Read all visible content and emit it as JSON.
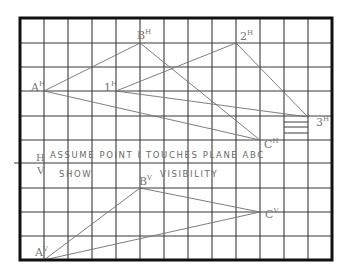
{
  "drawing": {
    "notes": {
      "line1": "ASSUME POINT I TOUCHES PLANE ABC",
      "line2a": "SHOW",
      "line2b": "VISIBILITY"
    },
    "fold_labels": {
      "top": "H",
      "bottom": "V"
    },
    "grid": {
      "cols": 13,
      "rows": 10,
      "x0": 20,
      "y0": 18,
      "x1": 332,
      "y1": 260
    },
    "points_horizontal": [
      {
        "id": "A",
        "label": "A",
        "sup": "H",
        "x": 44,
        "y": 91
      },
      {
        "id": "B",
        "label": "B",
        "sup": "H",
        "x": 140,
        "y": 43
      },
      {
        "id": "C",
        "label": "C",
        "sup": "H",
        "x": 260,
        "y": 140
      },
      {
        "id": "1",
        "label": "1",
        "sup": "H",
        "x": 116,
        "y": 91
      },
      {
        "id": "2",
        "label": "2",
        "sup": "H",
        "x": 236,
        "y": 43
      },
      {
        "id": "3",
        "label": "3",
        "sup": "H",
        "x": 308,
        "y": 117
      }
    ],
    "points_vertical": [
      {
        "id": "A",
        "label": "A",
        "sup": "V",
        "x": 44,
        "y": 260
      },
      {
        "id": "B",
        "label": "B",
        "sup": "V",
        "x": 140,
        "y": 188
      },
      {
        "id": "C",
        "label": "C",
        "sup": "V",
        "x": 260,
        "y": 212
      }
    ]
  }
}
